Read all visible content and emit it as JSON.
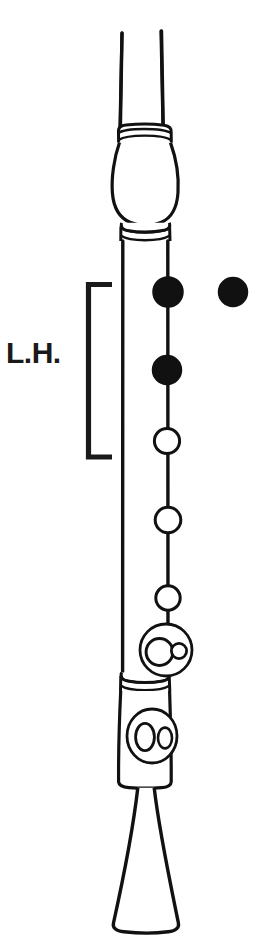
{
  "diagram": {
    "instrument": "recorder",
    "orientation": "vertical",
    "line_color": "#111111",
    "fill_color": "#111111",
    "background_color": "#ffffff",
    "hand_label": "L.H.",
    "hand_bracket": {
      "label": "L.H.",
      "covers": [
        "thumb",
        "hole-1",
        "hole-2",
        "hole-3"
      ]
    },
    "holes": [
      {
        "name": "thumb-hole",
        "state": "closed",
        "shape": "circle"
      },
      {
        "name": "hole-1",
        "state": "closed",
        "shape": "circle"
      },
      {
        "name": "hole-2",
        "state": "closed",
        "shape": "circle"
      },
      {
        "name": "hole-3",
        "state": "open",
        "shape": "circle"
      },
      {
        "name": "hole-4",
        "state": "open",
        "shape": "circle"
      },
      {
        "name": "hole-5",
        "state": "open",
        "shape": "circle"
      },
      {
        "name": "hole-6",
        "state": "open",
        "shape": "double-circle"
      },
      {
        "name": "hole-7",
        "state": "open",
        "shape": "double-circle"
      }
    ],
    "joints": [
      "head-joint",
      "barrel-bulge",
      "body-joint",
      "foot-joint",
      "bell"
    ]
  }
}
